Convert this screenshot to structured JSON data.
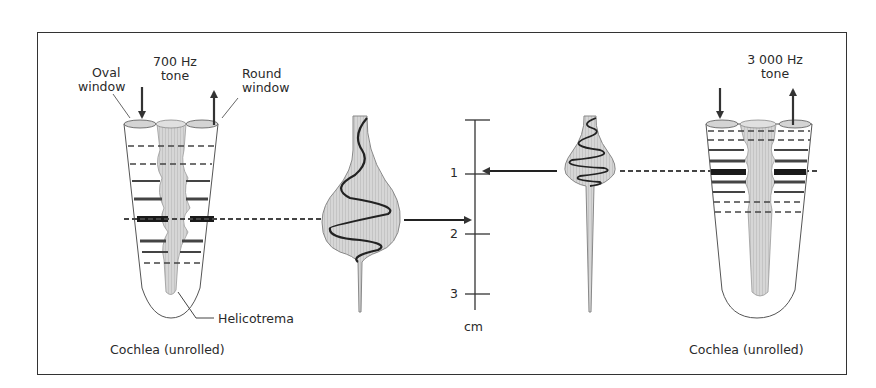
{
  "figure": {
    "left_panel": {
      "tone_label_line1": "700 Hz",
      "tone_label_line2": "tone",
      "oval_window_line1": "Oval",
      "oval_window_line2": "window",
      "round_window_line1": "Round",
      "round_window_line2": "window",
      "helicotrema_label": "Helicotrema",
      "caption": "Cochlea (unrolled)"
    },
    "scale": {
      "unit": "cm",
      "ticks": [
        "1",
        "2",
        "3"
      ]
    },
    "right_panel": {
      "tone_label_line1": "3 000 Hz",
      "tone_label_line2": "tone",
      "caption": "Cochlea (unrolled)"
    },
    "colors": {
      "stroke": "#333333",
      "fill_light": "#d8d8d8",
      "fill_membrane": "#c8c8c8",
      "band": "#222222"
    }
  }
}
